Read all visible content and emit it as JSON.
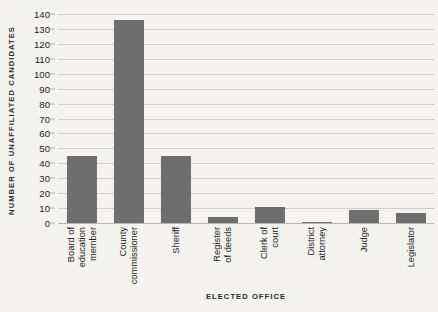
{
  "chart_data": {
    "type": "bar",
    "title": "",
    "xlabel": "ELECTED OFFICE",
    "ylabel": "NUMBER OF UNAFFILIATED CANDIDATES",
    "categories": [
      "Board of education member",
      "County commissioner",
      "Sheriff",
      "Register of deeds",
      "Clerk of court",
      "District attorney",
      "Judge",
      "Legislator"
    ],
    "category_lines": [
      [
        "Board of",
        "education",
        "member"
      ],
      [
        "County",
        "commissioner"
      ],
      [
        "Sheriff"
      ],
      [
        "Register",
        "of deeds"
      ],
      [
        "Clerk of",
        "court"
      ],
      [
        "District",
        "attorney"
      ],
      [
        "Judge"
      ],
      [
        "Legislator"
      ]
    ],
    "values": [
      45,
      136,
      45,
      4,
      11,
      1,
      9,
      7
    ],
    "ylim": [
      0,
      140
    ],
    "yticks": [
      0,
      10,
      20,
      30,
      40,
      50,
      60,
      70,
      80,
      90,
      100,
      110,
      120,
      130,
      140
    ],
    "ytick_labels": [
      "0",
      "10",
      "20",
      "30",
      "40",
      "50",
      "60",
      "70",
      "80",
      "90",
      "100",
      "110",
      "120",
      "130",
      "140"
    ],
    "grid": true,
    "legend": false,
    "legend_position": "none",
    "bar_color": "#6e6e6e",
    "background_color": "#f4f3ef",
    "gridline_color": "#cfcec8",
    "bar_width_ratio": 0.64
  }
}
